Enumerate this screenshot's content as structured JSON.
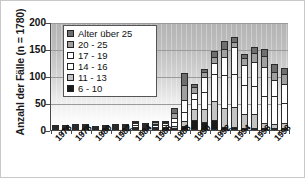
{
  "chart_data": {
    "type": "bar",
    "subtype": "stacked-vertical",
    "title": "",
    "ylabel": "Anzahl der Fälle  (n = 1780)",
    "xlabel": "",
    "ylim": [
      0,
      200
    ],
    "yticks": [
      0,
      50,
      100,
      150,
      200
    ],
    "grid": true,
    "grid_axis": "y",
    "legend_position": "upper-left-inside",
    "categories": [
      "1976",
      "1977",
      "1978",
      "1979",
      "1980",
      "1981",
      "1982",
      "1983",
      "1984",
      "1985",
      "1986",
      "1987",
      "1988",
      "1989",
      "1990",
      "1991",
      "1992",
      "1993",
      "1994",
      "1995",
      "1996",
      "1997",
      "1998",
      "1999"
    ],
    "tick_labels": [
      "1976",
      "",
      "1978",
      "",
      "1980",
      "",
      "1982",
      "",
      "1984",
      "",
      "1986",
      "",
      "1988",
      "",
      "1990",
      "",
      "1992",
      "",
      "1994",
      "",
      "1996",
      "",
      "1998",
      ""
    ],
    "series": [
      {
        "name": "6 - 10",
        "color": "#1a1a1a",
        "values": [
          1,
          1,
          1,
          1,
          1,
          0,
          1,
          1,
          2,
          1,
          2,
          2,
          3,
          7,
          19,
          15,
          19,
          6,
          5,
          3,
          3,
          2,
          2,
          3
        ]
      },
      {
        "name": "11 - 13",
        "color": "#c4c4c4",
        "values": [
          1,
          1,
          2,
          1,
          0,
          1,
          1,
          1,
          3,
          2,
          3,
          3,
          5,
          11,
          22,
          25,
          37,
          36,
          39,
          27,
          27,
          11,
          10,
          12
        ]
      },
      {
        "name": "14 - 16",
        "color": "#ffffff",
        "values": [
          1,
          1,
          4,
          1,
          1,
          2,
          2,
          2,
          5,
          4,
          5,
          6,
          9,
          19,
          21,
          35,
          52,
          64,
          63,
          56,
          54,
          52,
          53,
          38
        ]
      },
      {
        "name": "17 - 19",
        "color": "#ffffff",
        "values": [
          1,
          1,
          2,
          1,
          1,
          2,
          2,
          2,
          6,
          4,
          5,
          5,
          11,
          25,
          13,
          29,
          22,
          35,
          52,
          40,
          46,
          55,
          32,
          37
        ]
      },
      {
        "name": "20 - 25",
        "color": "#a0a0a0",
        "values": [
          0,
          0,
          1,
          1,
          0,
          1,
          1,
          1,
          4,
          3,
          4,
          4,
          10,
          28,
          12,
          11,
          12,
          17,
          11,
          15,
          19,
          22,
          17,
          20
        ]
      },
      {
        "name": "Alter über 25",
        "color": "#6e6e6e",
        "values": [
          0,
          0,
          0,
          0,
          0,
          0,
          0,
          0,
          4,
          3,
          3,
          4,
          11,
          24,
          8,
          8,
          14,
          16,
          12,
          8,
          14,
          16,
          15,
          14
        ]
      }
    ]
  },
  "legend": {
    "items": [
      {
        "label": "Alter über 25",
        "color": "#6e6e6e"
      },
      {
        "label": "20 - 25",
        "color": "#a0a0a0"
      },
      {
        "label": "17 - 19",
        "color": "#ffffff"
      },
      {
        "label": "14 - 16",
        "color": "#ffffff"
      },
      {
        "label": "11 - 13",
        "color": "#c4c4c4"
      },
      {
        "label": "6 - 10",
        "color": "#1a1a1a"
      }
    ]
  }
}
